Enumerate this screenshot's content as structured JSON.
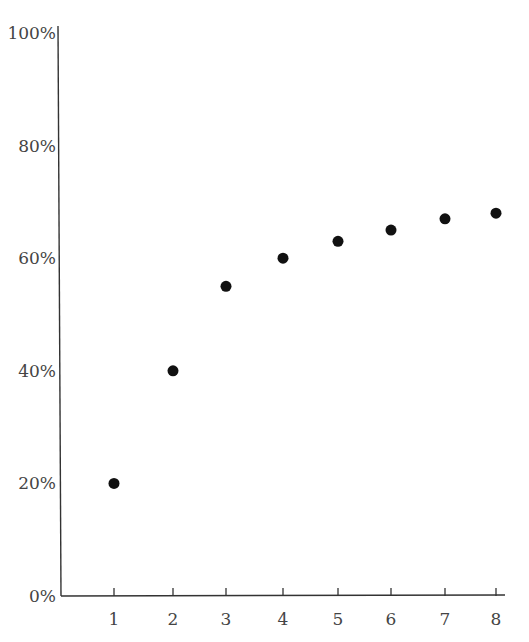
{
  "chart_data": {
    "type": "scatter",
    "title": "",
    "xlabel": "",
    "ylabel": "",
    "x": [
      1,
      2,
      3,
      4,
      5,
      6,
      7,
      8
    ],
    "values": [
      20,
      40,
      55,
      60,
      63,
      65,
      67,
      68
    ],
    "x_tick_labels": [
      "1",
      "2",
      "3",
      "4",
      "5",
      "6",
      "7",
      "8"
    ],
    "y_tick_labels": [
      "0%",
      "20%",
      "40%",
      "60%",
      "80%",
      "100%"
    ],
    "y_ticks": [
      0,
      20,
      40,
      60,
      80,
      100
    ],
    "ylim": [
      0,
      100
    ],
    "xlim": [
      0,
      8.1
    ],
    "grid": false,
    "legend": null,
    "marker_color": "#111111",
    "axis_color": "#333333"
  }
}
